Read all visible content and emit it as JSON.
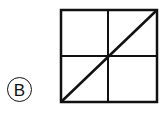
{
  "figure": {
    "label": "B",
    "shape": "square",
    "divisions": {
      "vertical_midline": true,
      "horizontal_midline": true,
      "diagonal": "bottom-left to top-right"
    },
    "colors": {
      "stroke": "#111111",
      "background": "#ffffff"
    }
  }
}
